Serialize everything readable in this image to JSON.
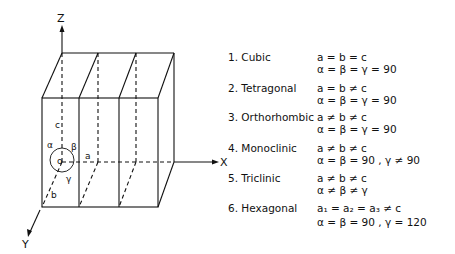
{
  "diagram": {
    "axes": {
      "z": "Z",
      "x": "X",
      "y": "Y"
    },
    "cell_labels": {
      "c": "c",
      "a_edge": "a",
      "b": "b",
      "origin": "o",
      "alpha": "α",
      "beta": "β",
      "gamma": "γ"
    }
  },
  "systems": [
    {
      "label": "1.  Cubic",
      "lengths": "a  =  b  =  c",
      "angles": "α  =  β  =  γ  =  90"
    },
    {
      "label": "2.  Tetragonal",
      "lengths": "a  =  b  ≠  c",
      "angles": "α  =  β  =  γ  =  90"
    },
    {
      "label": "3.  Orthorhombic",
      "lengths": "a  ≠  b  ≠  c",
      "angles": "α  =  β  =  γ  =  90"
    },
    {
      "label": "4.  Monoclinic",
      "lengths": "a  ≠  b  ≠  c",
      "angles": "α  =  β  =  90 ,  γ  ≠  90"
    },
    {
      "label": "5.  Triclinic",
      "lengths": "a  ≠  b  ≠  c",
      "angles": "α  ≠  β  ≠  γ"
    },
    {
      "label": "6.  Hexagonal",
      "lengths": "a₁  =  a₂  =  a₃  ≠  c",
      "angles": "α  =  β  =  90 ,  γ  =  120"
    }
  ]
}
